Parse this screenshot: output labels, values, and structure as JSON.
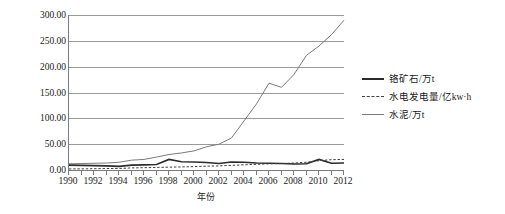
{
  "chart_data": {
    "type": "line",
    "title": "",
    "xlabel": "年份",
    "ylabel": "工业产品供给功能",
    "xlim": [
      1990,
      2012
    ],
    "ylim": [
      0,
      300
    ],
    "grid": true,
    "legend_position": "right",
    "x": [
      1990,
      1991,
      1992,
      1993,
      1994,
      1995,
      1996,
      1997,
      1998,
      1999,
      2000,
      2001,
      2002,
      2003,
      2004,
      2005,
      2006,
      2007,
      2008,
      2009,
      2010,
      2011,
      2012
    ],
    "xtick_labels": [
      "1990",
      "1992",
      "1994",
      "1996",
      "1998",
      "2000",
      "2002",
      "2004",
      "2006",
      "2008",
      "2010",
      "2012"
    ],
    "ytick_labels": [
      "0.00",
      "50.00",
      "100.00",
      "150.00",
      "200.00",
      "250.00",
      "300.00"
    ],
    "ytick_values": [
      0,
      50,
      100,
      150,
      200,
      250,
      300
    ],
    "series": [
      {
        "name": "铬矿石/万t",
        "style": "solid-thick",
        "color": "#2b2b2b",
        "values": [
          9.5,
          9.0,
          8.5,
          8.0,
          7.0,
          9.5,
          10.0,
          10.5,
          20.5,
          16.0,
          15.5,
          14.5,
          12.5,
          15.5,
          15.0,
          13.5,
          13.0,
          12.5,
          11.5,
          12.0,
          20.5,
          13.0,
          13.5
        ]
      },
      {
        "name": "水电发电量/亿kw·h",
        "style": "dashed",
        "color": "#3d3d3d",
        "values": [
          2.0,
          2.2,
          2.5,
          2.8,
          3.0,
          4.0,
          4.5,
          5.0,
          5.5,
          6.0,
          6.5,
          7.5,
          8.0,
          9.0,
          10.0,
          11.0,
          12.0,
          12.5,
          13.5,
          15.0,
          18.0,
          20.0,
          20.5
        ]
      },
      {
        "name": "水泥/万t",
        "style": "solid-thin",
        "color": "#7a7a7a",
        "values": [
          12.0,
          12.5,
          13.0,
          13.5,
          15.0,
          19.0,
          20.5,
          25.0,
          30.0,
          33.0,
          37.0,
          45.0,
          50.0,
          62.0,
          95.0,
          128.0,
          168.0,
          160.0,
          185.0,
          222.0,
          240.0,
          262.0,
          290.0
        ]
      }
    ]
  },
  "legend": {
    "entries": [
      {
        "label": "铬矿石/万t"
      },
      {
        "label": "水电发电量/亿kw·h"
      },
      {
        "label": "水泥/万t"
      }
    ]
  }
}
